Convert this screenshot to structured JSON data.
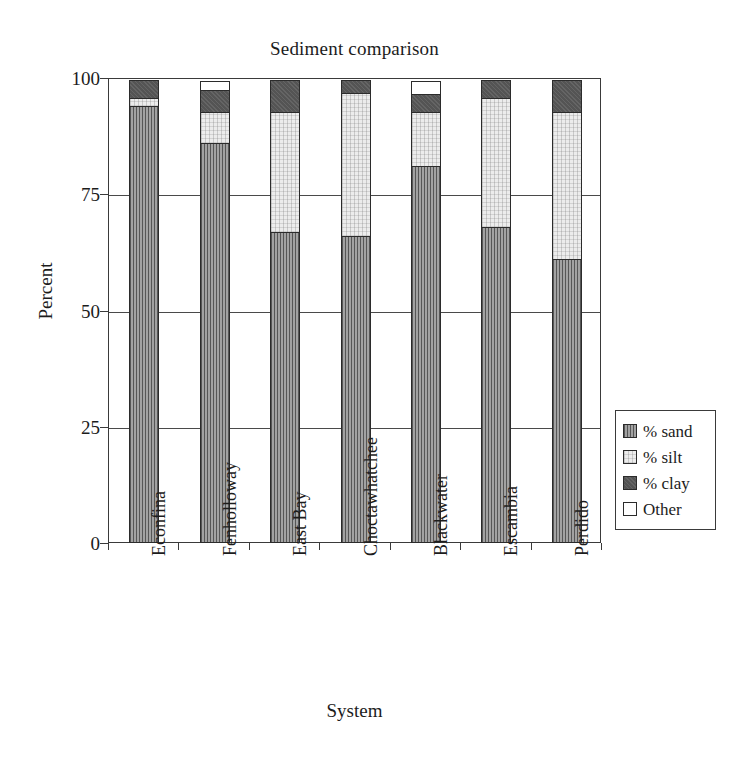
{
  "chart_data": {
    "type": "bar",
    "subtype": "stacked-bar",
    "title": "Sediment comparison",
    "xlabel": "System",
    "ylabel": "Percent",
    "ylim": [
      0,
      100
    ],
    "yticks": [
      0,
      25,
      50,
      75,
      100
    ],
    "ytick_labels": [
      "0",
      "25",
      "50",
      "75",
      "100"
    ],
    "grid": true,
    "grid_axis": "y",
    "legend_position": "right",
    "categories": [
      "Econfina",
      "Fenholloway",
      "East Bay",
      "Choctawhatchee",
      "Blackwater",
      "Escambia",
      "Perdido"
    ],
    "series": [
      {
        "name": "% sand",
        "color": "#8e8e8e",
        "pattern": "vertical-hatch",
        "values": [
          94,
          86,
          67,
          66,
          81,
          68,
          61
        ]
      },
      {
        "name": "% silt",
        "color": "#ececec",
        "pattern": "fine-speckle",
        "values": [
          2,
          7,
          26,
          31,
          12,
          28,
          32
        ]
      },
      {
        "name": "% clay",
        "color": "#595959",
        "pattern": "solid-dark",
        "values": [
          4,
          5,
          7,
          3,
          4,
          4,
          7
        ]
      },
      {
        "name": "Other",
        "color": "#ffffff",
        "pattern": "blank",
        "values": [
          0,
          2,
          0,
          0,
          3,
          0,
          0
        ]
      }
    ],
    "stack_order_bottom_to_top": [
      "% sand",
      "% silt",
      "% clay",
      "Other"
    ]
  },
  "legend": {
    "entries": [
      {
        "label": "% sand",
        "swatch": "sand-swatch"
      },
      {
        "label": "% silt",
        "swatch": "silt-swatch"
      },
      {
        "label": "% clay",
        "swatch": "clay-swatch"
      },
      {
        "label": "Other",
        "swatch": "other-swatch"
      }
    ]
  }
}
